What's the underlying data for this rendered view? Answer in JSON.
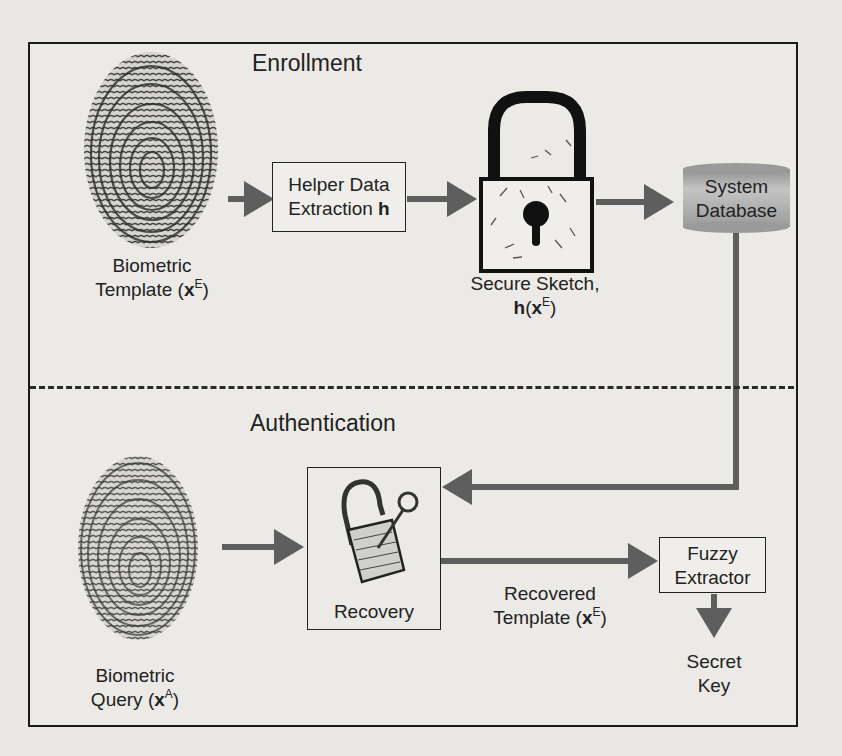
{
  "diagram": {
    "sections": {
      "enrollment": "Enrollment",
      "authentication": "Authentication"
    },
    "enrollment": {
      "biometric_template": {
        "line1": "Biometric",
        "line2_prefix": "Template (",
        "var": "x",
        "sup": "E",
        "suffix": ")"
      },
      "helper_box": {
        "line1": "Helper Data",
        "line2_prefix": "Extraction ",
        "line2_bold": "h"
      },
      "secure_sketch": {
        "line1": "Secure Sketch,",
        "func": "h",
        "open": "(",
        "var": "x",
        "sup": "E",
        "close": ")"
      },
      "database": {
        "line1": "System",
        "line2": "Database"
      }
    },
    "authentication": {
      "biometric_query": {
        "line1": "Biometric",
        "line2_prefix": "Query (",
        "var": "x",
        "sup": "A",
        "suffix": ")"
      },
      "recovery_box": {
        "label": "Recovery"
      },
      "recovered_template": {
        "line1": "Recovered",
        "line2_prefix": "Template (",
        "var": "x",
        "sup": "E",
        "suffix": ")"
      },
      "fuzzy_extractor": {
        "line1": "Fuzzy",
        "line2": "Extractor"
      },
      "secret_key": {
        "line1": "Secret",
        "line2": "Key"
      }
    },
    "colors": {
      "arrow": "#5e5e5e",
      "border": "#1a1a1a",
      "database_fill": "#a9a9a9",
      "background": "#e9e8e4"
    }
  }
}
